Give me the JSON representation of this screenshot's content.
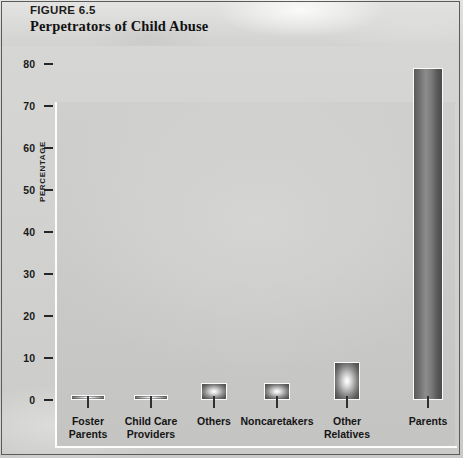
{
  "header": {
    "figure_number": "FIGURE 6.5",
    "title": "Perpetrators of Child Abuse"
  },
  "chart_data": {
    "type": "bar",
    "title": "Perpetrators of Child Abuse",
    "xlabel": "",
    "ylabel": "PERCENTAGE",
    "ylim": [
      0,
      80
    ],
    "yticks": [
      0,
      10,
      20,
      30,
      40,
      50,
      60,
      70,
      80
    ],
    "grid": false,
    "legend": null,
    "categories": [
      "Foster Parents",
      "Child Care Providers",
      "Others",
      "Noncaretakers",
      "Other Relatives",
      "Parents"
    ],
    "category_lines": [
      [
        "Foster",
        "Parents"
      ],
      [
        "Child Care",
        "Providers"
      ],
      [
        "Others",
        ""
      ],
      [
        "Noncaretakers",
        ""
      ],
      [
        "Other",
        "Relatives"
      ],
      [
        "Parents",
        ""
      ]
    ],
    "values": [
      0.5,
      1,
      4,
      4,
      9,
      79
    ]
  },
  "yticklabels": [
    "80",
    "70",
    "60",
    "50",
    "40",
    "30",
    "20",
    "10",
    "0"
  ],
  "colors": {
    "plot_background": "#cacac8",
    "header_background": "#dcdcda",
    "axis_line": "#fdfdfd",
    "bar_outline": "#fbfbfb",
    "text": "#151515"
  }
}
